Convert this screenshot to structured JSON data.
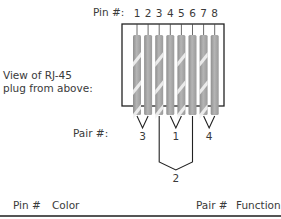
{
  "labels": {
    "pin_heading": "Pin #:",
    "view_caption_line1": "View of RJ-45",
    "view_caption_line2": "plug from above:",
    "pair_heading": "Pair #:"
  },
  "pins": [
    {
      "number": "1",
      "pattern": "striped"
    },
    {
      "number": "2",
      "pattern": "solid"
    },
    {
      "number": "3",
      "pattern": "striped"
    },
    {
      "number": "4",
      "pattern": "solid"
    },
    {
      "number": "5",
      "pattern": "striped"
    },
    {
      "number": "6",
      "pattern": "solid"
    },
    {
      "number": "7",
      "pattern": "striped"
    },
    {
      "number": "8",
      "pattern": "solid"
    }
  ],
  "pairs": [
    {
      "label": "3",
      "pins": [
        1,
        2
      ]
    },
    {
      "label": "1",
      "pins": [
        4,
        5
      ]
    },
    {
      "label": "4",
      "pins": [
        7,
        8
      ]
    },
    {
      "label": "2",
      "pins": [
        3,
        6
      ]
    }
  ],
  "table": {
    "headers": [
      "Pin #",
      "Color",
      "Pair #",
      "Function"
    ]
  },
  "colors": {
    "wire": "#a8a8a8",
    "stripe": "#eeeeee",
    "frame": "#222222"
  }
}
